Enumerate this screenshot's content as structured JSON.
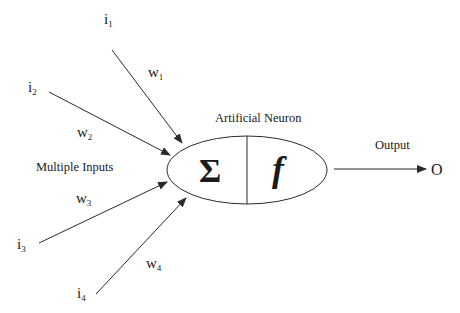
{
  "diagram": {
    "title": "Artificial Neuron",
    "group_label": "Multiple Inputs",
    "output_label": "Output",
    "output_symbol": "O",
    "summation_symbol": "Σ",
    "activation_symbol": "f",
    "inputs": [
      {
        "name": "i",
        "index": "1",
        "weight": "w",
        "weight_index": "1"
      },
      {
        "name": "i",
        "index": "2",
        "weight": "w",
        "weight_index": "2"
      },
      {
        "name": "i",
        "index": "3",
        "weight": "w",
        "weight_index": "3"
      },
      {
        "name": "i",
        "index": "4",
        "weight": "w",
        "weight_index": "4"
      }
    ],
    "colors": {
      "stroke": "#2a2a2a",
      "text": "#1a1a1a",
      "background": "#ffffff"
    }
  }
}
